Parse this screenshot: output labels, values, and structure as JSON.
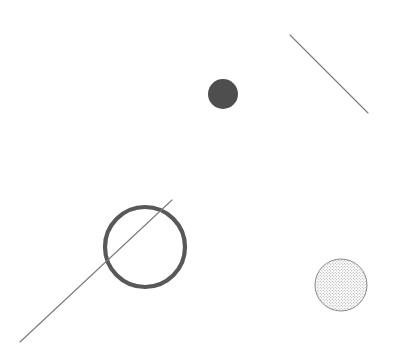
{
  "canvas": {
    "width": 401,
    "height": 363,
    "background_color": "#ffffff",
    "title": "Shapes Canvas"
  },
  "palette": {
    "filled_dot_color": "#4e4e4e",
    "ring_stroke_color": "#585858",
    "thin_line_color": "#7a7a7a",
    "stipple_outline_color": "#8a8a8a",
    "stipple_dot_color": "#9a9a9a",
    "background": "#ffffff"
  },
  "shapes": [
    {
      "id": "filled-dot",
      "kind": "circle-filled",
      "label": "Filled dark dot",
      "cx": 223,
      "cy": 94,
      "r": 15,
      "fill": "#4e4e4e",
      "stroke": "none",
      "stroke_width": 0
    },
    {
      "id": "upper-right-line",
      "kind": "line",
      "label": "Short diagonal line upper right",
      "x1": 290,
      "y1": 35,
      "x2": 368,
      "y2": 113,
      "stroke": "#7a7a7a",
      "stroke_width": 1.1
    },
    {
      "id": "outline-ring",
      "kind": "circle-outline",
      "label": "Large open ring",
      "cx": 145,
      "cy": 247,
      "r": 40,
      "fill": "none",
      "stroke": "#585858",
      "stroke_width": 4.2
    },
    {
      "id": "long-diagonal-line",
      "kind": "line",
      "label": "Long diagonal line through ring",
      "x1": 20,
      "y1": 342,
      "x2": 172,
      "y2": 200,
      "stroke": "#7a7a7a",
      "stroke_width": 1.1
    },
    {
      "id": "stippled-circle",
      "kind": "circle-stippled",
      "label": "Dotted texture circle",
      "cx": 341,
      "cy": 285,
      "r": 26,
      "fill": "dot-pattern",
      "stroke": "#8a8a8a",
      "stroke_width": 1,
      "pattern": {
        "type": "dots",
        "spacing": 3,
        "dot_radius": 0.55,
        "dot_color": "#9a9a9a"
      }
    }
  ]
}
